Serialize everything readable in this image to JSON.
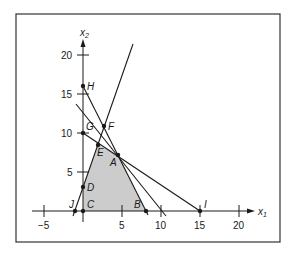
{
  "figure": {
    "type": "linear-programming-feasible-region",
    "axes": {
      "x_label": "x",
      "x_sub": "1",
      "y_label": "x",
      "y_sub": "2",
      "x_ticks": [
        "−5",
        "5",
        "10",
        "15",
        "20"
      ],
      "y_ticks": [
        "5",
        "10",
        "15",
        "20"
      ]
    },
    "points": {
      "A": "A",
      "B": "B",
      "C": "C",
      "D": "D",
      "E": "E",
      "F": "F",
      "G": "G",
      "H": "H",
      "I": "I",
      "J": "J"
    },
    "colors": {
      "feasible_fill": "#cccccc",
      "lines": "#1a1a1a",
      "frame": "#333333"
    }
  }
}
